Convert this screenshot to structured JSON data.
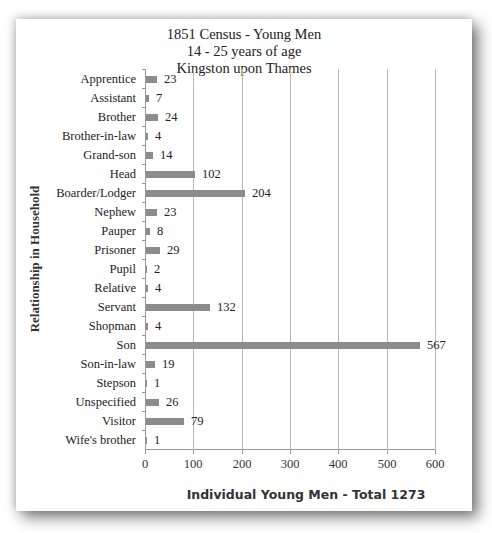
{
  "chart_data": {
    "type": "bar",
    "orientation": "horizontal",
    "title": "1851 Census - Young Men",
    "subtitle_lines": [
      "14 - 25 years of age",
      "Kingston upon Thames"
    ],
    "xlabel": "Individual Young Men - Total 1273",
    "ylabel": "Relationship in Household",
    "xlim": [
      0,
      600
    ],
    "xticks": [
      0,
      100,
      200,
      300,
      400,
      500,
      600
    ],
    "grid": "vertical",
    "legend": "none",
    "data_labels": true,
    "bar_color": "#8c8c8c",
    "categories": [
      "Apprentice",
      "Assistant",
      "Brother",
      "Brother-in-law",
      "Grand-son",
      "Head",
      "Boarder/Lodger",
      "Nephew",
      "Pauper",
      "Prisoner",
      "Pupil",
      "Relative",
      "Servant",
      "Shopman",
      "Son",
      "Son-in-law",
      "Stepson",
      "Unspecified",
      "Visitor",
      "Wife's brother"
    ],
    "values": [
      23,
      7,
      24,
      4,
      14,
      102,
      204,
      23,
      8,
      29,
      2,
      4,
      132,
      4,
      567,
      19,
      1,
      26,
      79,
      1
    ]
  },
  "title": {
    "line1": "1851 Census - Young Men",
    "line2": "14 - 25 years of age",
    "line3": "Kingston upon Thames"
  },
  "axes": {
    "xlabel": "Individual Young Men - Total 1273",
    "ylabel": "Relationship in Household",
    "xticks": [
      "0",
      "100",
      "200",
      "300",
      "400",
      "500",
      "600"
    ]
  }
}
